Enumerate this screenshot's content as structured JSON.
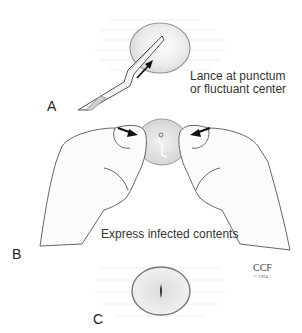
{
  "figure": {
    "panels": [
      {
        "letter": "A",
        "caption_line1": "Lance at punctum",
        "caption_line2": "or fluctuant center"
      },
      {
        "letter": "B",
        "caption_line1": "Express infected contents"
      },
      {
        "letter": "C"
      }
    ],
    "credit": {
      "org": "CCF",
      "year": "© 1994"
    },
    "colors": {
      "lesion_fill": "#e6e6e6",
      "lesion_edge": "#888888",
      "line": "#555555",
      "arrow": "#111111"
    }
  }
}
